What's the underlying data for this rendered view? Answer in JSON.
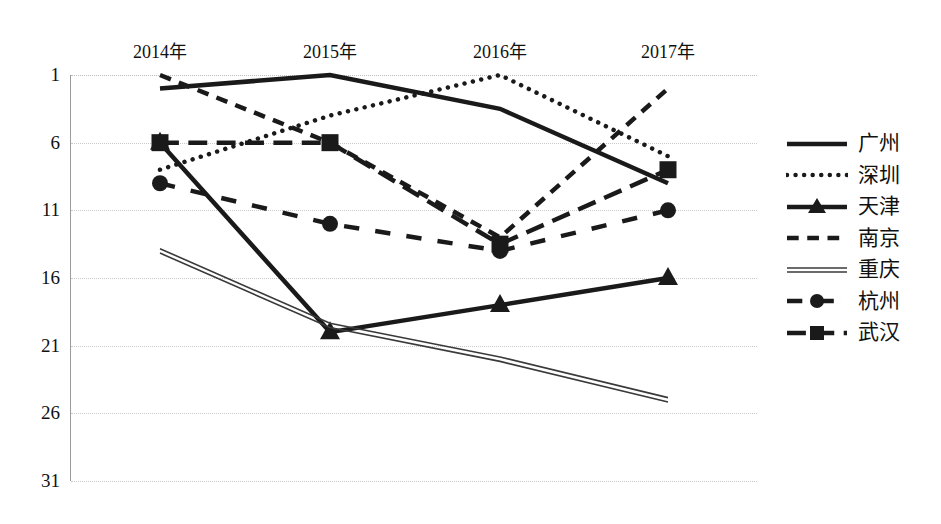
{
  "chart_data": {
    "type": "line",
    "title": "",
    "xlabel": "",
    "ylabel": "",
    "categories": [
      "2014年",
      "2015年",
      "2016年",
      "2017年"
    ],
    "yticks": [
      1,
      6,
      11,
      16,
      21,
      26,
      31
    ],
    "ylim": [
      1,
      31
    ],
    "y_axis_inverted": true,
    "grid": true,
    "legend_position": "right",
    "series": [
      {
        "name": "广州",
        "values": [
          2,
          1,
          3.5,
          9
        ],
        "style": "solid",
        "marker": "none",
        "color": "#1a1a1a",
        "width": 4.5
      },
      {
        "name": "深圳",
        "values": [
          8,
          4,
          1,
          7
        ],
        "style": "dotted",
        "marker": "none",
        "color": "#1a1a1a",
        "width": 4.5
      },
      {
        "name": "天津",
        "values": [
          6,
          20,
          18,
          16
        ],
        "style": "solid",
        "marker": "triangle",
        "color": "#1a1a1a",
        "width": 4.5
      },
      {
        "name": "南京",
        "values": [
          1,
          6,
          13,
          2
        ],
        "style": "dashed",
        "marker": "none",
        "color": "#1a1a1a",
        "width": 4.5
      },
      {
        "name": "重庆",
        "values": [
          14,
          19.5,
          22,
          25
        ],
        "style": "thin-double",
        "marker": "none",
        "color": "#3a3a3a",
        "width": 1.6
      },
      {
        "name": "杭州",
        "values": [
          9,
          12,
          14,
          11
        ],
        "style": "dash-dot",
        "marker": "circle",
        "color": "#1a1a1a",
        "width": 4.5
      },
      {
        "name": "武汉",
        "values": [
          6,
          6,
          13.5,
          8
        ],
        "style": "long-dash",
        "marker": "square",
        "color": "#1a1a1a",
        "width": 4.5
      }
    ]
  },
  "legend": {
    "items": [
      {
        "label": "广州",
        "icon": "line-solid-swatch"
      },
      {
        "label": "深圳",
        "icon": "line-dotted-swatch"
      },
      {
        "label": "天津",
        "icon": "line-solid-triangle-swatch"
      },
      {
        "label": "南京",
        "icon": "line-dashed-swatch"
      },
      {
        "label": "重庆",
        "icon": "line-thin-double-swatch"
      },
      {
        "label": "杭州",
        "icon": "line-dashdot-circle-swatch"
      },
      {
        "label": "武汉",
        "icon": "line-dashdot-square-swatch"
      }
    ]
  },
  "axes": {
    "y_tick_labels": [
      "1",
      "6",
      "11",
      "16",
      "21",
      "26",
      "31"
    ],
    "x_tick_labels": [
      "2014年",
      "2015年",
      "2016年",
      "2017年"
    ]
  }
}
